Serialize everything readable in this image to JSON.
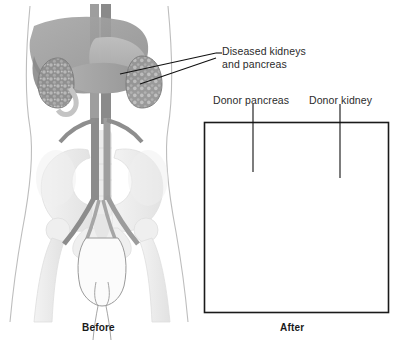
{
  "figure": {
    "width": 399,
    "height": 346,
    "background_color": "#ffffff"
  },
  "labels": {
    "diseased_line1": "Diseased kidneys",
    "diseased_line2": "and pancreas",
    "donor_pancreas": "Donor pancreas",
    "donor_kidney": "Donor kidney"
  },
  "captions": {
    "before": "Before",
    "after": "After"
  },
  "panels": {
    "before": {
      "caption": "Before",
      "organs": [
        "liver",
        "stomach",
        "pancreas",
        "diseased-left-kidney",
        "diseased-right-kidney",
        "aorta",
        "inferior-vena-cava",
        "iliac-arteries",
        "bladder",
        "pelvis",
        "femur-left",
        "femur-right",
        "spine"
      ]
    },
    "after": {
      "caption": "After",
      "bordered": true,
      "border_color": "#1a1a1a",
      "organs": [
        "donor-pancreas",
        "duodenal-segment",
        "donor-kidney",
        "aorta",
        "inferior-vena-cava",
        "iliac-arteries",
        "transplant-vessels",
        "ureter",
        "bladder",
        "pelvis",
        "femur-left",
        "femur-right",
        "spine"
      ]
    }
  },
  "colors": {
    "text": "#2b2b2b",
    "caption_text": "#1a1a1a",
    "leader_line": "#111111",
    "panel_border": "#1a1a1a",
    "body_outline": "#b5b5b5",
    "bone": "#ededed",
    "bone_edge": "#d9d9d9",
    "liver": "#9a9a9a",
    "stomach": "#b3b3b3",
    "pancreas": "#a6a6a6",
    "diseased_kidney": "#8e8e8e",
    "donor_kidney": "#a0a0a0",
    "vessel_dark": "#7d7d7d",
    "vessel_light": "#bcbcbc"
  }
}
